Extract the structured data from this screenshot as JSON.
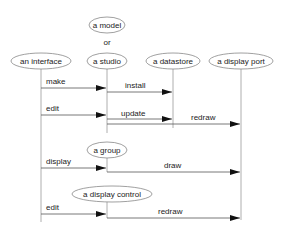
{
  "objects": {
    "model": "a model",
    "or": "or",
    "interface": "an interface",
    "studio": "a studio",
    "datastore": "a datastore",
    "display_port": "a display port",
    "group": "a group",
    "display_control": "a display control"
  },
  "messages": {
    "make": "make",
    "install": "install",
    "edit1": "edit",
    "update": "update",
    "redraw1": "redraw",
    "display": "display",
    "draw": "draw",
    "edit2": "edit",
    "redraw2": "redraw"
  },
  "colors": {
    "line": "#888888",
    "arrow": "#111111",
    "text": "#222222"
  }
}
